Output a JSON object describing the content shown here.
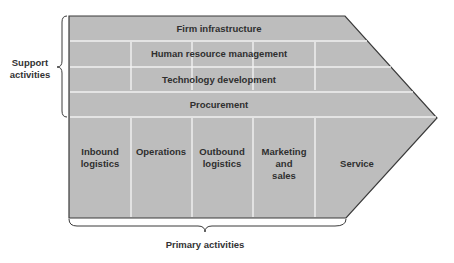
{
  "diagram": {
    "type": "value-chain",
    "colors": {
      "fill": "#bdbdbd",
      "outline": "#3a3a3a",
      "divider": "#f2f2f2",
      "text": "#2f2f2f"
    },
    "support_label_line1": "Support",
    "support_label_line2": "activities",
    "primary_label": "Primary activities",
    "support_activities": [
      {
        "label": "Firm infrastructure"
      },
      {
        "label": "Human resource management"
      },
      {
        "label": "Technology development"
      },
      {
        "label": "Procurement"
      }
    ],
    "primary_activities": [
      {
        "lines": [
          "Inbound",
          "logistics"
        ]
      },
      {
        "lines": [
          "Operations"
        ]
      },
      {
        "lines": [
          "Outbound",
          "logistics"
        ]
      },
      {
        "lines": [
          "Marketing",
          "and",
          "sales"
        ]
      },
      {
        "lines": [
          "Service"
        ]
      }
    ]
  }
}
